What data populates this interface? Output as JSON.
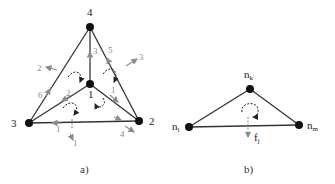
{
  "figure_a": {
    "caption": "a)",
    "nodes": [
      {
        "id": "1",
        "label": "1"
      },
      {
        "id": "2",
        "label": "2"
      },
      {
        "id": "3",
        "label": "3"
      },
      {
        "id": "4",
        "label": "4"
      }
    ],
    "edges": [
      [
        "4",
        "3"
      ],
      [
        "4",
        "2"
      ],
      [
        "3",
        "2"
      ],
      [
        "1",
        "4"
      ],
      [
        "1",
        "3"
      ],
      [
        "1",
        "2"
      ]
    ],
    "grey_labels": {
      "edge_1_4": "3",
      "edge_2_4": "5",
      "out_upper_right": "3",
      "out_upper_left": "2",
      "edge_3_4": "6",
      "edge_1_3": "2",
      "edge_1_2": "1",
      "edge_3_2": "1",
      "out_bottom": "1",
      "out_bottom_right": "4"
    }
  },
  "figure_b": {
    "caption": "b)",
    "nodes": {
      "top": {
        "base": "n",
        "sub": "k"
      },
      "left": {
        "base": "n",
        "sub": "l"
      },
      "right": {
        "base": "n",
        "sub": "m"
      }
    },
    "force": {
      "base": "f",
      "sub": "j"
    }
  },
  "colors": {
    "edge": "#333333",
    "node": "#111111",
    "grey": "#8c8c8c"
  }
}
